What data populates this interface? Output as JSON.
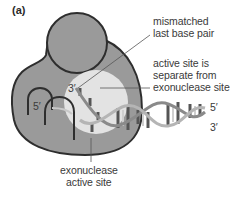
{
  "panel_label": "(a)",
  "labels": {
    "mismatched": [
      "mismatched",
      "last base pair"
    ],
    "active_site": [
      "active site is",
      "separate from",
      "exonuclease site"
    ],
    "exonuclease": [
      "exonuclease",
      "active site"
    ]
  },
  "strand_ends": {
    "left_3prime": "3′",
    "left_5prime": "5′",
    "right_5prime": "5′",
    "right_3prime": "3′"
  },
  "colors": {
    "protein": "#9a9a9a",
    "protein_outline": "#2e2e2e",
    "active_site": "#e3e3e3",
    "dna_backbone": "#8a8a8a",
    "text": "#3a3a3a"
  }
}
